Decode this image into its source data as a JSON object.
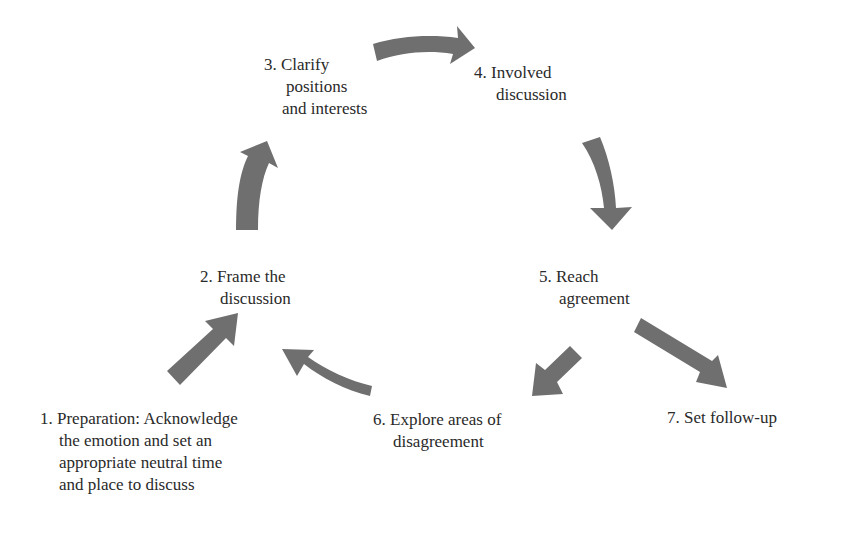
{
  "diagram": {
    "type": "process-cycle",
    "arrow_color": "#6f6f6f",
    "steps": [
      {
        "id": 1,
        "lines": [
          "1. Preparation: Acknowledge",
          "the emotion and set an",
          "appropriate neutral time",
          "and place to discuss"
        ]
      },
      {
        "id": 2,
        "lines": [
          "2. Frame the",
          "discussion"
        ]
      },
      {
        "id": 3,
        "lines": [
          "3. Clarify",
          "positions",
          "and interests"
        ]
      },
      {
        "id": 4,
        "lines": [
          "4. Involved",
          "discussion"
        ]
      },
      {
        "id": 5,
        "lines": [
          "5. Reach",
          "agreement"
        ]
      },
      {
        "id": 6,
        "lines": [
          "6. Explore areas of",
          "disagreement"
        ]
      },
      {
        "id": 7,
        "lines": [
          "7. Set follow-up"
        ]
      }
    ],
    "arrows": [
      {
        "from": 1,
        "to": 2
      },
      {
        "from": 2,
        "to": 3
      },
      {
        "from": 3,
        "to": 4
      },
      {
        "from": 4,
        "to": 5
      },
      {
        "from": 5,
        "to": 6
      },
      {
        "from": 5,
        "to": 7
      },
      {
        "from": 6,
        "to": 2
      }
    ]
  }
}
